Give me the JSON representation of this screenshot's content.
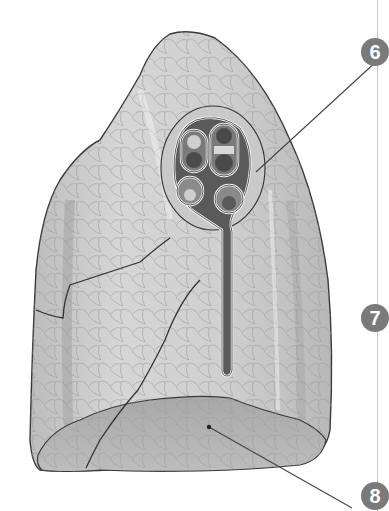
{
  "figure": {
    "colors": {
      "background": "#ffffff",
      "lung_fill_light": "#d9d9d9",
      "lung_fill_mid": "#bdbdbd",
      "lung_fill_dark": "#8e8e8e",
      "outline": "#3a3a3a",
      "hilum_dark": "#3c3c3c",
      "leader_line": "#444444",
      "badge": "#7a7a7a"
    },
    "labels": [
      {
        "number": "6",
        "x": 361,
        "y": 38,
        "target": "hilum"
      },
      {
        "number": "7",
        "x": 361,
        "y": 304,
        "target": "lateral surface"
      },
      {
        "number": "8",
        "x": 361,
        "y": 482,
        "target": "diaphragmatic surface"
      }
    ]
  }
}
